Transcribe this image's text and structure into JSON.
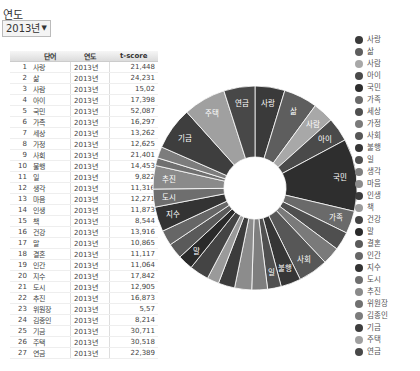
{
  "filter": {
    "label": "연도",
    "selected": "2013년",
    "arrow": "▼"
  },
  "table": {
    "columns": [
      "",
      "단어",
      "연도",
      "t-score"
    ],
    "rows": [
      {
        "idx": "1",
        "word": "사랑",
        "year": "2013년",
        "score": "21,448"
      },
      {
        "idx": "2",
        "word": "삶",
        "year": "2013년",
        "score": "24,231"
      },
      {
        "idx": "3",
        "word": "사람",
        "year": "2013년",
        "score": "15,02"
      },
      {
        "idx": "4",
        "word": "아이",
        "year": "2013년",
        "score": "17,398"
      },
      {
        "idx": "5",
        "word": "국민",
        "year": "2013년",
        "score": "52,087"
      },
      {
        "idx": "6",
        "word": "가족",
        "year": "2013년",
        "score": "16,297"
      },
      {
        "idx": "7",
        "word": "세상",
        "year": "2013년",
        "score": "13,262"
      },
      {
        "idx": "8",
        "word": "가정",
        "year": "2013년",
        "score": "12,625"
      },
      {
        "idx": "9",
        "word": "사회",
        "year": "2013년",
        "score": "21,401"
      },
      {
        "idx": "10",
        "word": "불행",
        "year": "2013년",
        "score": "14,453"
      },
      {
        "idx": "11",
        "word": "일",
        "year": "2013년",
        "score": "9,822"
      },
      {
        "idx": "12",
        "word": "생각",
        "year": "2013년",
        "score": "11,316"
      },
      {
        "idx": "13",
        "word": "마음",
        "year": "2013년",
        "score": "12,271"
      },
      {
        "idx": "14",
        "word": "인생",
        "year": "2013년",
        "score": "11,873"
      },
      {
        "idx": "15",
        "word": "책",
        "year": "2013년",
        "score": "8,544"
      },
      {
        "idx": "16",
        "word": "건강",
        "year": "2013년",
        "score": "13,916"
      },
      {
        "idx": "17",
        "word": "말",
        "year": "2013년",
        "score": "10,865"
      },
      {
        "idx": "18",
        "word": "결혼",
        "year": "2013년",
        "score": "11,117"
      },
      {
        "idx": "19",
        "word": "인간",
        "year": "2013년",
        "score": "11,064"
      },
      {
        "idx": "20",
        "word": "지수",
        "year": "2013년",
        "score": "17,842"
      },
      {
        "idx": "21",
        "word": "도시",
        "year": "2013년",
        "score": "12,905"
      },
      {
        "idx": "22",
        "word": "추진",
        "year": "2013년",
        "score": "16,873"
      },
      {
        "idx": "23",
        "word": "위원장",
        "year": "2013년",
        "score": "5,57"
      },
      {
        "idx": "24",
        "word": "김종인",
        "year": "2013년",
        "score": "8,214"
      },
      {
        "idx": "25",
        "word": "기금",
        "year": "2013년",
        "score": "30,711"
      },
      {
        "idx": "26",
        "word": "주택",
        "year": "2013년",
        "score": "30,518"
      },
      {
        "idx": "27",
        "word": "연금",
        "year": "2013년",
        "score": "22,389"
      }
    ]
  },
  "chart_data": {
    "type": "pie",
    "donut": true,
    "title": "",
    "start_angle": "top, clockwise",
    "legend_position": "right",
    "categories": [
      "사랑",
      "삶",
      "사람",
      "아이",
      "국민",
      "가족",
      "세상",
      "가정",
      "사회",
      "불행",
      "일",
      "생각",
      "마음",
      "인생",
      "책",
      "건강",
      "말",
      "결혼",
      "인간",
      "지수",
      "도시",
      "추진",
      "위원장",
      "김종인",
      "기금",
      "주택",
      "연금"
    ],
    "values": [
      21.448,
      24.231,
      15.02,
      17.398,
      52.087,
      16.297,
      13.262,
      12.625,
      21.401,
      14.453,
      9.822,
      11.316,
      12.271,
      11.873,
      8.544,
      13.916,
      10.865,
      11.117,
      11.064,
      17.842,
      12.905,
      16.873,
      5.57,
      8.214,
      30.711,
      30.518,
      22.389
    ],
    "colors": [
      "#3a3a3a",
      "#5e5e5e",
      "#a8a8a8",
      "#4a4a4a",
      "#2e2e2e",
      "#6a6a6a",
      "#4f4f4f",
      "#7a7a7a",
      "#575757",
      "#363636",
      "#505050",
      "#7e7e7e",
      "#8c8c8c",
      "#3c3c3c",
      "#9a9a9a",
      "#444444",
      "#2a2a2a",
      "#5a5a5a",
      "#666666",
      "#333333",
      "#6e6e6e",
      "#8a8a8a",
      "#707070",
      "#7c7c7c",
      "#3e3e3e",
      "#a0a0a0",
      "#484848"
    ],
    "slice_labels": [
      "사랑",
      "삶",
      "사람",
      "아이",
      "국민",
      "가족",
      "",
      "",
      "사회",
      "불행",
      "일",
      "",
      "",
      "",
      "",
      "",
      "말",
      "",
      "",
      "지수",
      "도시",
      "추진",
      "",
      "",
      "기금",
      "주택",
      "연금"
    ]
  }
}
